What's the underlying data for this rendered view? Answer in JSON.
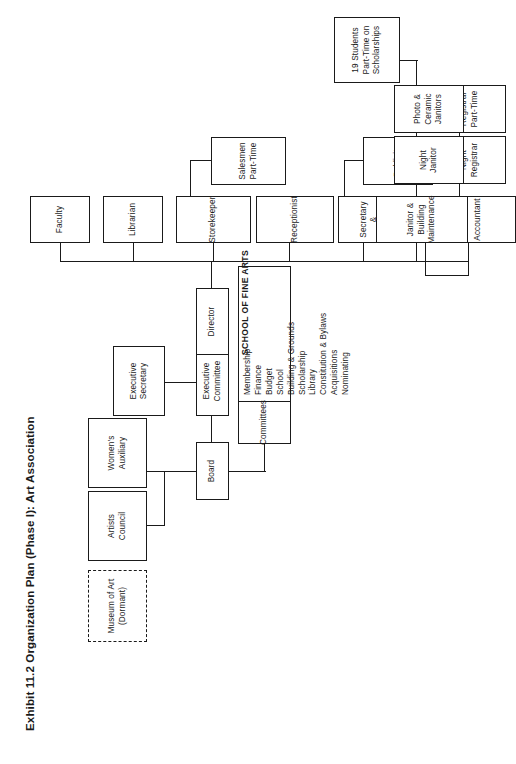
{
  "page": {
    "title": "Exhibit 11.2 Organization Plan (Phase I): Art Association",
    "background": "#ffffff",
    "line_color": "#1a1a1a"
  },
  "captions": {
    "school_of_fine_arts": "SCHOOL OF FINE ARTS"
  },
  "nodes": {
    "artists_council": "Artists\nCouncil",
    "womens_auxiliary": "Women's\nAuxiliary",
    "museum_of_art": "Museum of Art\n(Dormant)",
    "board": "Board",
    "executive_committee": "Executive\nCommittee",
    "executive_secretary": "Executive\nSecretary",
    "committees_head": "Committees",
    "director": "Director",
    "faculty": "Faculty",
    "librarian": "Librarian",
    "storekeeper": "Storekeeper",
    "salesmen_part_time": "Salesmen\nPart-Time",
    "receptionist": "Receptionist",
    "secretary_publicity": "Secretary &\nPublicity",
    "publicity": "Publicity",
    "registrar": "Registrar",
    "night_registrar": "Night\nRegistrar",
    "registrar_part_time": "Registrar\nPart-Time",
    "students_scholarships": "19 Students\nPart-Time on\nScholarships",
    "accountant": "Accountant",
    "janitor_building_maintenance": "Janitor &\nBuilding\nMaintenance",
    "night_janitor": "Night\nJanitor",
    "photo_ceramic_janitors": "Photo &\nCeramic\nJanitors"
  },
  "committee_list": [
    "Membership",
    "Finance",
    "Budget",
    "School",
    "Building & Grounds",
    "Scholarship",
    "Library",
    "Constitution & Bylaws",
    "Acquisitions",
    "Nominating"
  ],
  "chart_data": {
    "type": "diagram",
    "title": "Exhibit 11.2 Organization Plan (Phase I): Art Association",
    "orientation": "rotated-90-ccw",
    "root": "Board",
    "relations": [
      {
        "parent": "Board",
        "child": "Artists Council"
      },
      {
        "parent": "Board",
        "child": "Women's Auxiliary"
      },
      {
        "parent": "Board",
        "child": "Executive Committee"
      },
      {
        "parent": "Board",
        "child": "Committees"
      },
      {
        "parent": "Executive Committee",
        "child": "Executive Secretary"
      },
      {
        "parent": "Executive Committee",
        "child": "Director"
      },
      {
        "parent": "Director",
        "child": "Faculty"
      },
      {
        "parent": "Director",
        "child": "Librarian"
      },
      {
        "parent": "Director",
        "child": "Storekeeper"
      },
      {
        "parent": "Director",
        "child": "Receptionist"
      },
      {
        "parent": "Director",
        "child": "Secretary & Publicity"
      },
      {
        "parent": "Director",
        "child": "Registrar"
      },
      {
        "parent": "Director",
        "child": "Accountant"
      },
      {
        "parent": "Director",
        "child": "Janitor & Building Maintenance"
      },
      {
        "parent": "Storekeeper",
        "child": "Salesmen Part-Time"
      },
      {
        "parent": "Secretary & Publicity",
        "child": "Publicity"
      },
      {
        "parent": "Registrar",
        "child": "Night Registrar"
      },
      {
        "parent": "Registrar",
        "child": "Registrar Part-Time"
      },
      {
        "parent": "Registrar",
        "child": "19 Students Part-Time on Scholarships"
      },
      {
        "parent": "Janitor & Building Maintenance",
        "child": "Night Janitor"
      },
      {
        "parent": "Janitor & Building Maintenance",
        "child": "Photo & Ceramic Janitors"
      }
    ],
    "dormant_nodes": [
      "Museum of Art (Dormant)"
    ]
  }
}
